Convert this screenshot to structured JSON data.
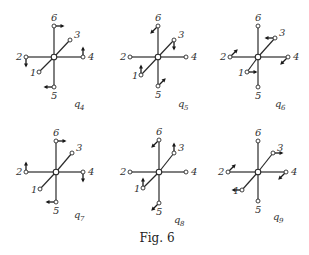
{
  "figure": {
    "caption": "Fig. 6",
    "panels": [
      {
        "id": "q4",
        "label": "q",
        "subscript": "4",
        "center": [
          54,
          57
        ],
        "nodes": {
          "1": [
            39,
            72
          ],
          "2": [
            26,
            57
          ],
          "3": [
            70,
            40
          ],
          "4": [
            83,
            57
          ],
          "5": [
            54,
            87
          ],
          "6": [
            54,
            26
          ]
        },
        "node_labels": {
          "1": "1",
          "2": "2",
          "3": "3",
          "4": "4",
          "5": "5",
          "6": "6"
        },
        "arrows": [
          {
            "node": "6",
            "dir": "right"
          },
          {
            "node": "4",
            "dir": "up"
          },
          {
            "node": "2",
            "dir": "down"
          },
          {
            "node": "5",
            "dir": "left"
          }
        ],
        "label_pos": [
          79,
          107
        ]
      },
      {
        "id": "q5",
        "label": "q",
        "subscript": "5",
        "center": [
          158,
          57
        ],
        "nodes": {
          "1": [
            141,
            75
          ],
          "2": [
            130,
            57
          ],
          "3": [
            174,
            40
          ],
          "4": [
            186,
            57
          ],
          "5": [
            158,
            86
          ],
          "6": [
            158,
            26
          ]
        },
        "node_labels": {
          "1": "1",
          "2": "2",
          "3": "3",
          "4": "4",
          "5": "5",
          "6": "6"
        },
        "arrows": [
          {
            "node": "6",
            "dir": "down-left"
          },
          {
            "node": "3",
            "dir": "down"
          },
          {
            "node": "1",
            "dir": "up"
          },
          {
            "node": "5",
            "dir": "up-right"
          }
        ],
        "label_pos": [
          183,
          107
        ]
      },
      {
        "id": "q6",
        "label": "q",
        "subscript": "6",
        "center": [
          258,
          57
        ],
        "nodes": {
          "1": [
            247,
            72
          ],
          "2": [
            230,
            57
          ],
          "3": [
            275,
            38
          ],
          "4": [
            288,
            57
          ],
          "5": [
            258,
            87
          ],
          "6": [
            258,
            26
          ]
        },
        "node_labels": {
          "1": "1",
          "2": "2",
          "3": "3",
          "4": "4",
          "5": "5",
          "6": "6"
        },
        "arrows": [
          {
            "node": "3",
            "dir": "left"
          },
          {
            "node": "2",
            "dir": "up-right"
          },
          {
            "node": "4",
            "dir": "down-left"
          },
          {
            "node": "1",
            "dir": "right"
          }
        ],
        "label_pos": [
          280,
          107
        ]
      },
      {
        "id": "q7",
        "label": "q",
        "subscript": "7",
        "center": [
          56,
          172
        ],
        "nodes": {
          "1": [
            40,
            189
          ],
          "2": [
            26,
            172
          ],
          "3": [
            72,
            153
          ],
          "4": [
            83,
            172
          ],
          "5": [
            56,
            202
          ],
          "6": [
            56,
            141
          ]
        },
        "node_labels": {
          "1": "1",
          "2": "2",
          "3": "3",
          "4": "4",
          "5": "5",
          "6": "6"
        },
        "arrows": [
          {
            "node": "6",
            "dir": "right"
          },
          {
            "node": "2",
            "dir": "up"
          },
          {
            "node": "4",
            "dir": "down"
          },
          {
            "node": "5",
            "dir": "left"
          }
        ],
        "label_pos": [
          79,
          218
        ]
      },
      {
        "id": "q8",
        "label": "q",
        "subscript": "8",
        "center": [
          159,
          172
        ],
        "nodes": {
          "1": [
            143,
            188
          ],
          "2": [
            130,
            172
          ],
          "3": [
            174,
            153
          ],
          "4": [
            186,
            172
          ],
          "5": [
            159,
            203
          ],
          "6": [
            159,
            140
          ]
        },
        "node_labels": {
          "1": "1",
          "2": "2",
          "3": "3",
          "4": "4",
          "5": "5",
          "6": "6"
        },
        "arrows": [
          {
            "node": "6",
            "dir": "down-left"
          },
          {
            "node": "3",
            "dir": "up"
          },
          {
            "node": "1",
            "dir": "up"
          },
          {
            "node": "5",
            "dir": "down-left"
          }
        ],
        "label_pos": [
          179,
          223
        ]
      },
      {
        "id": "q9",
        "label": "q",
        "subscript": "9",
        "center": [
          258,
          172
        ],
        "nodes": {
          "1": [
            242,
            190
          ],
          "2": [
            228,
            172
          ],
          "3": [
            273,
            153
          ],
          "4": [
            286,
            172
          ],
          "5": [
            258,
            201
          ],
          "6": [
            258,
            141
          ]
        },
        "node_labels": {
          "1": "1",
          "2": "2",
          "3": "3",
          "4": "4",
          "5": "5",
          "6": "6"
        },
        "arrows": [
          {
            "node": "3",
            "dir": "right"
          },
          {
            "node": "2",
            "dir": "up-right"
          },
          {
            "node": "4",
            "dir": "down-left"
          },
          {
            "node": "1",
            "dir": "left"
          }
        ],
        "label_pos": [
          278,
          220
        ]
      }
    ]
  }
}
